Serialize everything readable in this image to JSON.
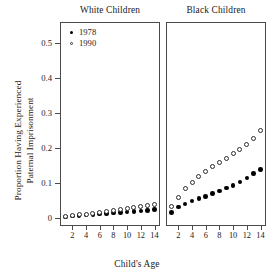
{
  "chart_data": {
    "type": "scatter",
    "title": "",
    "xlabel": "Child's Age",
    "ylabel_line1": "Proportion Having Experienced",
    "ylabel_line2": "Paternal Imprisonment",
    "x": [
      1,
      2,
      3,
      4,
      5,
      6,
      7,
      8,
      9,
      10,
      11,
      12,
      13,
      14
    ],
    "xlim": [
      0.2,
      14.8
    ],
    "ylim": [
      -0.022,
      0.56
    ],
    "xticks": [
      2,
      4,
      6,
      8,
      10,
      12,
      14
    ],
    "xtick_labels": [
      "2",
      "4",
      "6",
      "8",
      "10",
      "12",
      "14"
    ],
    "yticks": [
      0,
      0.1,
      0.2,
      0.3,
      0.4,
      0.5
    ],
    "ytick_labels": [
      "0",
      "0.1",
      "0.2",
      "0.3",
      "0.4",
      "0.5"
    ],
    "grid": false,
    "legend_position": "top-left-of-first-panel",
    "legend": [
      {
        "label": "1978",
        "marker": "filled-circle"
      },
      {
        "label": "1990",
        "marker": "open-circle"
      }
    ],
    "panels": [
      {
        "title": "White Children",
        "series": [
          {
            "name": "1978",
            "marker": "filled-circle",
            "values": [
              0.004,
              0.006,
              0.008,
              0.009,
              0.011,
              0.012,
              0.013,
              0.015,
              0.016,
              0.018,
              0.02,
              0.021,
              0.023,
              0.025
            ]
          },
          {
            "name": "1990",
            "marker": "open-circle",
            "values": [
              0.005,
              0.008,
              0.01,
              0.012,
              0.014,
              0.017,
              0.02,
              0.023,
              0.026,
              0.029,
              0.031,
              0.034,
              0.037,
              0.04
            ]
          }
        ]
      },
      {
        "title": "Black Children",
        "series": [
          {
            "name": "1978",
            "marker": "filled-circle",
            "values": [
              0.017,
              0.032,
              0.041,
              0.049,
              0.056,
              0.063,
              0.07,
              0.078,
              0.086,
              0.094,
              0.104,
              0.115,
              0.127,
              0.14
            ]
          },
          {
            "name": "1990",
            "marker": "open-circle",
            "values": [
              0.035,
              0.06,
              0.084,
              0.103,
              0.118,
              0.133,
              0.147,
              0.16,
              0.172,
              0.184,
              0.196,
              0.21,
              0.228,
              0.25
            ]
          }
        ]
      }
    ]
  }
}
